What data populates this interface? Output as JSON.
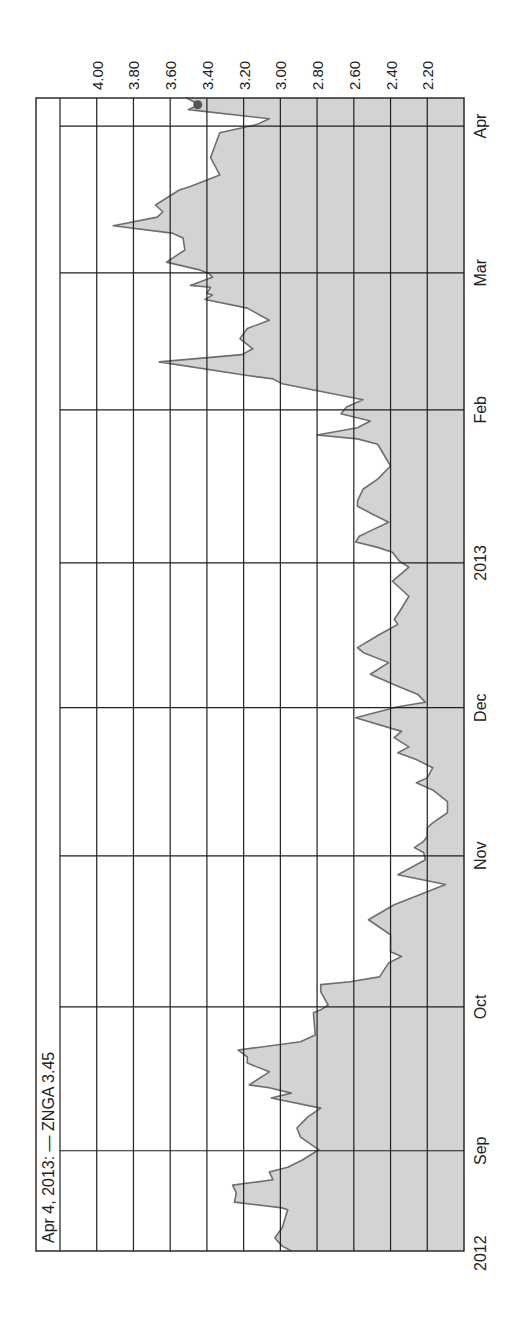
{
  "header": {
    "text": "Apr 4, 2013:  —  ZNGA 3.45"
  },
  "colors": {
    "background": "#ffffff",
    "grid": "#1f1f1f",
    "line": "#6e6e6e",
    "fill": "#d3d3d3",
    "dot": "#555555",
    "text": "#222222"
  },
  "chart_data": {
    "type": "area",
    "title": "Apr 4, 2013: — ZNGA 3.45",
    "ticker": "ZNGA",
    "last_date": "Apr 4, 2013",
    "last_value": 3.45,
    "orientation": "rotated 90° clockwise (time runs bottom→top, value axis along top)",
    "xlabel": "",
    "ylabel": "",
    "ylim": [
      2.0,
      4.2
    ],
    "y_ticks": [
      "4.00",
      "3.80",
      "3.60",
      "3.40",
      "3.20",
      "3.00",
      "2.80",
      "2.60",
      "2.40",
      "2.20"
    ],
    "y_tick_values": [
      4.0,
      3.8,
      3.6,
      3.4,
      3.2,
      3.0,
      2.8,
      2.6,
      2.4,
      2.2
    ],
    "x_ticks": [
      {
        "label": "2012",
        "t": 0
      },
      {
        "label": "Sep",
        "t": 20.7
      },
      {
        "label": "Oct",
        "t": 50.4
      },
      {
        "label": "Nov",
        "t": 81.6
      },
      {
        "label": "Dec",
        "t": 112.2
      },
      {
        "label": "2013",
        "t": 142.1
      },
      {
        "label": "Feb",
        "t": 173.7
      },
      {
        "label": "Mar",
        "t": 202.0
      },
      {
        "label": "Apr",
        "t": 232.3
      }
    ],
    "grid": true,
    "legend": "none",
    "t_unit": "days since start of visible range (~Aug 9, 2012)",
    "series": [
      {
        "name": "ZNGA",
        "points": [
          [
            0,
            2.94
          ],
          [
            1,
            2.99
          ],
          [
            2.7,
            3.03
          ],
          [
            4.8,
            2.99
          ],
          [
            8.5,
            2.96
          ],
          [
            8.9,
            2.99
          ],
          [
            10.1,
            3.25
          ],
          [
            12.0,
            3.24
          ],
          [
            13.6,
            3.26
          ],
          [
            14.7,
            3.04
          ],
          [
            16.3,
            3.06
          ],
          [
            17.3,
            2.96
          ],
          [
            18.8,
            2.88
          ],
          [
            20.9,
            2.79
          ],
          [
            23.5,
            2.89
          ],
          [
            25.4,
            2.91
          ],
          [
            27.7,
            2.85
          ],
          [
            29.5,
            2.78
          ],
          [
            31.6,
            3.05
          ],
          [
            32.6,
            2.94
          ],
          [
            33.7,
            3.06
          ],
          [
            34.3,
            3.17
          ],
          [
            37.0,
            3.06
          ],
          [
            38.8,
            3.18
          ],
          [
            40.1,
            3.18
          ],
          [
            41.5,
            3.23
          ],
          [
            43.2,
            2.89
          ],
          [
            44.6,
            2.81
          ],
          [
            49.2,
            2.82
          ],
          [
            49.8,
            2.78
          ],
          [
            50.8,
            2.74
          ],
          [
            53.5,
            2.78
          ],
          [
            55.0,
            2.78
          ],
          [
            55.6,
            2.62
          ],
          [
            56.6,
            2.46
          ],
          [
            59.5,
            2.41
          ],
          [
            60.8,
            2.34
          ],
          [
            61.8,
            2.4
          ],
          [
            65.3,
            2.4
          ],
          [
            68.4,
            2.52
          ],
          [
            71.5,
            2.38
          ],
          [
            75.7,
            2.1
          ],
          [
            76.3,
            2.18
          ],
          [
            77.7,
            2.36
          ],
          [
            80.8,
            2.21
          ],
          [
            82.3,
            2.22
          ],
          [
            83.3,
            2.27
          ],
          [
            84.6,
            2.22
          ],
          [
            85.6,
            2.2
          ],
          [
            87.4,
            2.2
          ],
          [
            88.4,
            2.17
          ],
          [
            90.5,
            2.09
          ],
          [
            92.8,
            2.09
          ],
          [
            95.2,
            2.17
          ],
          [
            96.7,
            2.26
          ],
          [
            97.7,
            2.2
          ],
          [
            99.8,
            2.17
          ],
          [
            101.5,
            2.26
          ],
          [
            102.9,
            2.36
          ],
          [
            104.1,
            2.3
          ],
          [
            106.0,
            2.38
          ],
          [
            107.3,
            2.34
          ],
          [
            110.1,
            2.59
          ],
          [
            112.4,
            2.36
          ],
          [
            113.3,
            2.21
          ],
          [
            114.9,
            2.25
          ],
          [
            116.6,
            2.36
          ],
          [
            119.1,
            2.51
          ],
          [
            121.5,
            2.41
          ],
          [
            123.6,
            2.55
          ],
          [
            124.6,
            2.58
          ],
          [
            127.3,
            2.46
          ],
          [
            129.4,
            2.36
          ],
          [
            130.4,
            2.38
          ],
          [
            132.1,
            2.35
          ],
          [
            135.2,
            2.3
          ],
          [
            136.6,
            2.34
          ],
          [
            138.3,
            2.39
          ],
          [
            141.2,
            2.3
          ],
          [
            142.4,
            2.35
          ],
          [
            144.3,
            2.39
          ],
          [
            145.3,
            2.47
          ],
          [
            146.4,
            2.59
          ],
          [
            147.6,
            2.57
          ],
          [
            148.7,
            2.51
          ],
          [
            150.5,
            2.41
          ],
          [
            152.2,
            2.5
          ],
          [
            153.8,
            2.58
          ],
          [
            154.9,
            2.58
          ],
          [
            157.3,
            2.55
          ],
          [
            159.4,
            2.47
          ],
          [
            162.1,
            2.4
          ],
          [
            166.6,
            2.47
          ],
          [
            167.7,
            2.58
          ],
          [
            168.5,
            2.8
          ],
          [
            170.0,
            2.58
          ],
          [
            171.4,
            2.51
          ],
          [
            172.9,
            2.67
          ],
          [
            174.3,
            2.64
          ],
          [
            175.8,
            2.55
          ],
          [
            179.1,
            2.99
          ],
          [
            180.1,
            3.04
          ],
          [
            180.8,
            3.18
          ],
          [
            183.6,
            3.66
          ],
          [
            185.1,
            3.21
          ],
          [
            186.3,
            3.15
          ],
          [
            188.4,
            3.22
          ],
          [
            190.5,
            3.18
          ],
          [
            192.2,
            3.06
          ],
          [
            194.7,
            3.18
          ],
          [
            196.5,
            3.41
          ],
          [
            197.4,
            3.37
          ],
          [
            197.8,
            3.4
          ],
          [
            199.0,
            3.38
          ],
          [
            199.4,
            3.49
          ],
          [
            201.1,
            3.37
          ],
          [
            201.9,
            3.39
          ],
          [
            202.6,
            3.44
          ],
          [
            204.2,
            3.62
          ],
          [
            206.7,
            3.52
          ],
          [
            209.2,
            3.53
          ],
          [
            210.2,
            3.59
          ],
          [
            211.7,
            3.91
          ],
          [
            213.5,
            3.67
          ],
          [
            214.6,
            3.64
          ],
          [
            216.0,
            3.68
          ],
          [
            219.1,
            3.55
          ],
          [
            219.8,
            3.49
          ],
          [
            222.2,
            3.33
          ],
          [
            225.8,
            3.38
          ],
          [
            230.9,
            3.33
          ],
          [
            232.6,
            3.13
          ],
          [
            233.8,
            3.06
          ],
          [
            235.7,
            3.5
          ],
          [
            236.7,
            3.44
          ],
          [
            238.1,
            3.51
          ]
        ]
      }
    ]
  }
}
